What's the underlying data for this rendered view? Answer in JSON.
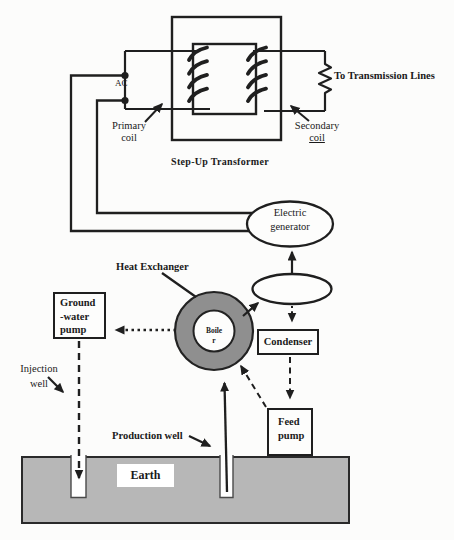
{
  "colors": {
    "line": "#1f1f1f",
    "earth_fill": "#b7b7b7",
    "exchanger_fill": "#8f8f8f",
    "well_fill": "#ffffff",
    "background": "#fcfcfb"
  },
  "transformer": {
    "title": "Step-Up Transformer",
    "ac_label": "AC",
    "primary_coil": {
      "line1": "Primary",
      "line2": "coil"
    },
    "secondary_coil": {
      "line1": "Secondary",
      "line2": "coil"
    },
    "transmission_label": "To Transmission Lines"
  },
  "generator": {
    "line1": "Electric",
    "line2": "generator"
  },
  "heat_exchanger": {
    "label": "Heat Exchanger",
    "boiler_line1": "Boile",
    "boiler_line2": "r"
  },
  "condenser": {
    "label": "Condenser"
  },
  "feed_pump": {
    "line1": "Feed",
    "line2": "pump"
  },
  "ground_water_pump": {
    "line1": "Ground",
    "line2": "-water",
    "line3": "pump"
  },
  "wells": {
    "injection": {
      "line1": "Injection",
      "line2": "well"
    },
    "production_label": "Production well"
  },
  "earth_label": "Earth"
}
